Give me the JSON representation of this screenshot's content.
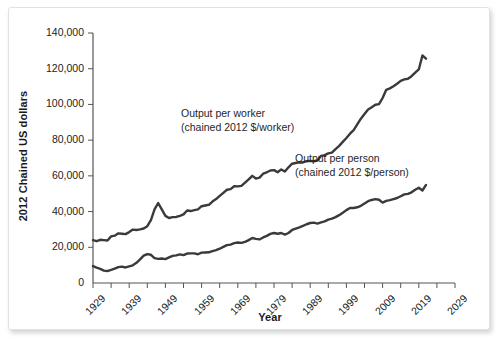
{
  "figure": {
    "background_color": "#ffffff",
    "card_border_color": "#e2e2e2",
    "line_color": "#3a3a3a",
    "axis_color": "#555555"
  },
  "axes": {
    "y_title": "2012 Chained US dollars",
    "x_title": "Year",
    "y_ticks": [
      "0",
      "20,000",
      "40,000",
      "60,000",
      "80,000",
      "100,000",
      "120,000",
      "140,000"
    ],
    "x_ticks": [
      "1929",
      "1939",
      "1949",
      "1959",
      "1969",
      "1979",
      "1989",
      "1999",
      "2009",
      "2019",
      "2029"
    ]
  },
  "annotations": {
    "worker_line1": "Output per worker",
    "worker_line2": "(chained 2012 $/worker)",
    "person_line1": "Output per person",
    "person_line2": "(chained 2012 $/person)"
  },
  "chart_data": {
    "type": "line",
    "title": "",
    "xlabel": "Year",
    "ylabel": "2012 Chained US dollars",
    "xlim": [
      1929,
      2029
    ],
    "ylim": [
      0,
      140000
    ],
    "xticks": [
      1929,
      1939,
      1949,
      1959,
      1969,
      1979,
      1989,
      1999,
      2009,
      2019,
      2029
    ],
    "yticks": [
      0,
      20000,
      40000,
      60000,
      80000,
      100000,
      120000,
      140000
    ],
    "minor_xtick_interval": 5,
    "grid": false,
    "legend": "inline-annotations",
    "x": [
      1929,
      1930,
      1931,
      1932,
      1933,
      1934,
      1935,
      1936,
      1937,
      1938,
      1939,
      1940,
      1941,
      1942,
      1943,
      1944,
      1945,
      1946,
      1947,
      1948,
      1949,
      1950,
      1951,
      1952,
      1953,
      1954,
      1955,
      1956,
      1957,
      1958,
      1959,
      1960,
      1961,
      1962,
      1963,
      1964,
      1965,
      1966,
      1967,
      1968,
      1969,
      1970,
      1971,
      1972,
      1973,
      1974,
      1975,
      1976,
      1977,
      1978,
      1979,
      1980,
      1981,
      1982,
      1983,
      1984,
      1985,
      1986,
      1987,
      1988,
      1989,
      1990,
      1991,
      1992,
      1993,
      1994,
      1995,
      1996,
      1997,
      1998,
      1999,
      2000,
      2001,
      2002,
      2003,
      2004,
      2005,
      2006,
      2007,
      2008,
      2009,
      2010,
      2011,
      2012,
      2013,
      2014,
      2015,
      2016,
      2017,
      2018,
      2019,
      2020,
      2021
    ],
    "series": [
      {
        "name": "Output per worker (chained 2012 $/worker)",
        "label_line1": "Output per worker",
        "label_line2": "(chained 2012 $/worker)",
        "color": "#3a3a3a",
        "values": [
          24000,
          23400,
          24200,
          24000,
          23800,
          26100,
          26500,
          27800,
          27600,
          27400,
          28500,
          29900,
          29700,
          30000,
          30500,
          31800,
          35200,
          41200,
          44800,
          41200,
          37600,
          36400,
          36900,
          37000,
          37600,
          38400,
          40600,
          40300,
          40800,
          41200,
          43000,
          43400,
          43800,
          45600,
          47000,
          48800,
          50500,
          52200,
          52600,
          54200,
          54100,
          54400,
          56200,
          58000,
          60000,
          58500,
          59000,
          61200,
          62000,
          63000,
          63200,
          62000,
          63600,
          62400,
          64800,
          66800,
          67200,
          67600,
          67500,
          68200,
          68400,
          68200,
          68600,
          71200,
          71600,
          72600,
          73000,
          75000,
          76800,
          79000,
          81200,
          83600,
          85600,
          88800,
          92000,
          94600,
          97200,
          98400,
          99800,
          100200,
          103600,
          108200,
          109000,
          110200,
          111600,
          113200,
          114000,
          114400,
          115800,
          117800,
          119600,
          127400,
          125600
        ]
      },
      {
        "name": "Output per person (chained 2012 $/person)",
        "label_line1": "Output per person",
        "label_line2": "(chained 2012 $/person)",
        "color": "#3a3a3a",
        "values": [
          9500,
          8600,
          7900,
          6900,
          6700,
          7300,
          8000,
          8900,
          9200,
          8700,
          9300,
          9900,
          11300,
          13200,
          15300,
          16200,
          15800,
          13900,
          13500,
          13700,
          13400,
          14300,
          15200,
          15500,
          16000,
          15600,
          16500,
          16600,
          16600,
          16100,
          17000,
          17100,
          17200,
          17900,
          18400,
          19200,
          20200,
          21200,
          21500,
          22300,
          22700,
          22500,
          23000,
          24000,
          25200,
          24700,
          24400,
          25500,
          26400,
          27500,
          28000,
          27600,
          28000,
          27100,
          28000,
          29700,
          30500,
          31200,
          32000,
          32900,
          33600,
          33800,
          33300,
          34000,
          34500,
          35500,
          36000,
          36900,
          38000,
          39300,
          40800,
          42000,
          42000,
          42400,
          43200,
          44500,
          45800,
          46500,
          47000,
          46600,
          45000,
          46000,
          46400,
          47000,
          47600,
          48600,
          49600,
          49900,
          50800,
          52200,
          53300,
          51800,
          54900
        ]
      }
    ]
  }
}
